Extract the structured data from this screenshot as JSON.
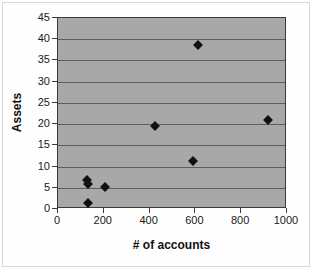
{
  "chart_data": {
    "type": "scatter",
    "title": "",
    "xlabel": "# of accounts",
    "ylabel": "Assets",
    "xlim": [
      0,
      1000
    ],
    "ylim": [
      0,
      45
    ],
    "xticks": [
      0,
      200,
      400,
      600,
      800,
      1000
    ],
    "yticks": [
      0,
      5,
      10,
      15,
      20,
      25,
      30,
      35,
      40,
      45
    ],
    "xtick_labels": [
      "0",
      "200",
      "400",
      "600",
      "800",
      "1000"
    ],
    "ytick_labels": [
      "0",
      "5",
      "10",
      "15",
      "20",
      "25",
      "30",
      "35",
      "40",
      "45"
    ],
    "grid": "horizontal",
    "legend": null,
    "plot_background": "#a8a8a8",
    "marker_color": "#111111",
    "marker_shape": "diamond",
    "points": [
      {
        "x": 125,
        "y": 6.8
      },
      {
        "x": 133,
        "y": 5.8
      },
      {
        "x": 205,
        "y": 5.3
      },
      {
        "x": 130,
        "y": 1.3
      },
      {
        "x": 425,
        "y": 19.5
      },
      {
        "x": 590,
        "y": 11.2
      },
      {
        "x": 610,
        "y": 38.7
      },
      {
        "x": 915,
        "y": 21.0
      }
    ]
  }
}
